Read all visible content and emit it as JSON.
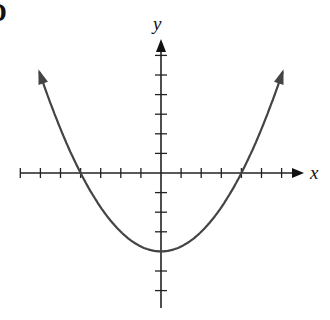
{
  "corner_label": "D",
  "chart_data": {
    "type": "line",
    "title": "",
    "xlabel": "x",
    "ylabel": "y",
    "function": "y = x^2/4 - 4",
    "xlim": [
      -7,
      7
    ],
    "ylim": [
      -7,
      6
    ],
    "grid": false,
    "legend": null,
    "x_ticks": [
      -7,
      -6,
      -5,
      -4,
      -3,
      -2,
      -1,
      1,
      2,
      3,
      4,
      5,
      6
    ],
    "y_ticks": [
      -6,
      -5,
      -4,
      -3,
      -2,
      -1,
      1,
      2,
      3,
      4,
      5,
      6
    ],
    "tick_labels_shown": false,
    "key_points": {
      "vertex": [
        0,
        -4
      ],
      "x_intercepts": [
        [
          -4,
          0
        ],
        [
          4,
          0
        ]
      ],
      "y_intercept": [
        0,
        -4
      ]
    },
    "series": [
      {
        "name": "parabola",
        "x": [
          -6.2,
          -6,
          -5,
          -4,
          -3,
          -2,
          -1,
          0,
          1,
          2,
          3,
          4,
          5,
          6,
          6.2
        ],
        "y": [
          5.61,
          5,
          2.25,
          0,
          -1.75,
          -3,
          -3.75,
          -4,
          -3.75,
          -3,
          -1.75,
          0,
          2.25,
          5,
          5.61
        ],
        "arrows_at_ends": true
      }
    ],
    "color": "#444444"
  }
}
